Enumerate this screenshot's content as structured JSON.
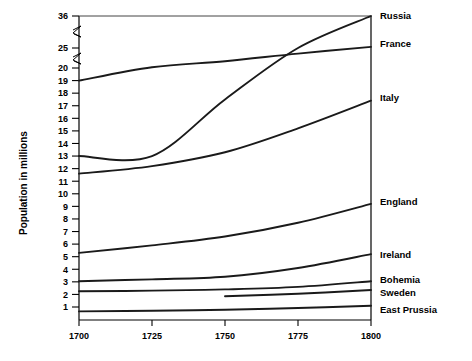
{
  "chart_data": {
    "type": "line",
    "title": "",
    "subtitle": "",
    "xlabel": "",
    "ylabel": "Population in millions",
    "x": [
      1700,
      1725,
      1750,
      1775,
      1800
    ],
    "xlim": [
      1700,
      1800
    ],
    "xticks": [
      "1700",
      "1725",
      "1750",
      "1775",
      "1800"
    ],
    "ylim": [
      0,
      36
    ],
    "yticks": [
      "36",
      "25",
      "20",
      "19",
      "18",
      "17",
      "16",
      "15",
      "14",
      "13",
      "12",
      "11",
      "10",
      "9",
      "8",
      "7",
      "6",
      "5",
      "4",
      "3",
      "2",
      "1"
    ],
    "y_axis_break": true,
    "y_axis_break_note": "axis broken between 25 and 36, and between 20 and 25",
    "grid": false,
    "legend": "right-inline-labels",
    "series": [
      {
        "name": "Russia",
        "label": "Russia",
        "x": [
          1700,
          1725,
          1750,
          1775,
          1800
        ],
        "values": [
          13.0,
          13.0,
          17.5,
          25.0,
          36.0
        ],
        "note": "flat 1700-1725 then steep rise, crosses France near 1778"
      },
      {
        "name": "France",
        "label": "France",
        "x": [
          1700,
          1725,
          1750,
          1775,
          1800
        ],
        "values": [
          19.0,
          20.2,
          21.7,
          23.6,
          25.4
        ]
      },
      {
        "name": "Italy",
        "label": "Italy",
        "x": [
          1700,
          1725,
          1750,
          1775,
          1800
        ],
        "values": [
          11.6,
          12.2,
          13.3,
          15.2,
          17.4
        ]
      },
      {
        "name": "England",
        "label": "England",
        "x": [
          1700,
          1725,
          1750,
          1775,
          1800
        ],
        "values": [
          5.3,
          5.9,
          6.6,
          7.7,
          9.2
        ]
      },
      {
        "name": "Ireland",
        "label": "Ireland",
        "x": [
          1700,
          1725,
          1750,
          1775,
          1800
        ],
        "values": [
          3.05,
          3.2,
          3.4,
          4.1,
          5.2
        ]
      },
      {
        "name": "Bohemia",
        "label": "Bohemia",
        "x": [
          1700,
          1725,
          1750,
          1775,
          1800
        ],
        "values": [
          2.25,
          2.3,
          2.4,
          2.6,
          3.05
        ]
      },
      {
        "name": "Sweden",
        "label": "Sweden",
        "x": [
          1750,
          1775,
          1800
        ],
        "values": [
          1.85,
          2.05,
          2.35
        ],
        "note": "series begins at 1750"
      },
      {
        "name": "East Prussia",
        "label": "East Prussia",
        "x": [
          1700,
          1725,
          1750,
          1775,
          1800
        ],
        "values": [
          0.65,
          0.7,
          0.78,
          0.92,
          1.1
        ]
      }
    ]
  },
  "colors": {
    "line": "#1a1a1a",
    "axis": "#000000",
    "background": "#ffffff"
  }
}
